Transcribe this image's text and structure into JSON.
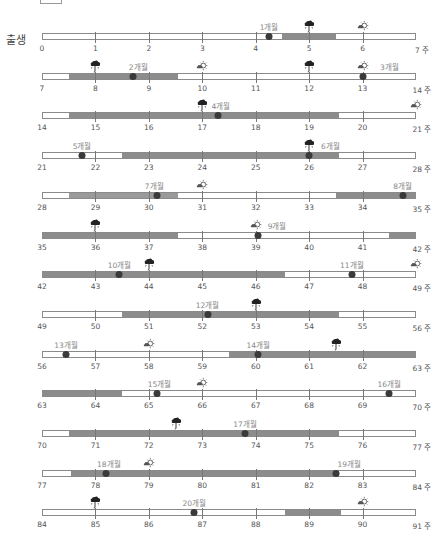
{
  "header": {
    "start_label": "출생",
    "unit": "주"
  },
  "legend_icons": {
    "rain": "cloud-rain-icon",
    "sun": "sun-cloud-icon"
  },
  "colors": {
    "segment": "#8c8c8c",
    "dot": "#3a3a3a",
    "bar_border": "#8a8a8a",
    "month_text": "#888888"
  },
  "rows": [
    {
      "start": 0,
      "ticks": [
        "0",
        "1",
        "2",
        "3",
        "4",
        "5",
        "6",
        "7 주"
      ],
      "segments": [
        [
          4.5,
          5.5
        ]
      ],
      "dots": [
        {
          "w": 4.25,
          "label": "1개월",
          "label_w": 4.25
        }
      ],
      "icons": [
        {
          "type": "rain",
          "w": 5
        },
        {
          "type": "sun",
          "w": 6
        }
      ]
    },
    {
      "start": 7,
      "ticks": [
        "7",
        "8",
        "9",
        "10",
        "11",
        "12",
        "13",
        "14 주"
      ],
      "segments": [
        [
          7.5,
          9.55
        ]
      ],
      "dots": [
        {
          "w": 8.7,
          "label": "2개월",
          "label_w": 8.8
        },
        {
          "w": 13,
          "label": "3개월",
          "label_w": 13.5
        }
      ],
      "icons": [
        {
          "type": "rain",
          "w": 8
        },
        {
          "type": "sun",
          "w": 10
        },
        {
          "type": "rain",
          "w": 12
        },
        {
          "type": "sun",
          "w": 13
        }
      ]
    },
    {
      "start": 14,
      "ticks": [
        "14",
        "15",
        "16",
        "17",
        "18",
        "19",
        "20",
        "21 주"
      ],
      "segments": [
        [
          14.5,
          19.55
        ]
      ],
      "dots": [
        {
          "w": 17.3,
          "label": "4개월",
          "label_w": 17.35
        }
      ],
      "icons": [
        {
          "type": "rain",
          "w": 17
        },
        {
          "type": "sun",
          "w": 21
        }
      ]
    },
    {
      "start": 21,
      "ticks": [
        "21",
        "22",
        "23",
        "24",
        "25",
        "26",
        "27",
        "28 주"
      ],
      "segments": [
        [
          22.5,
          26.55
        ]
      ],
      "dots": [
        {
          "w": 21.75,
          "label": "5개월",
          "label_w": 21.75
        },
        {
          "w": 26,
          "label": "6개월",
          "label_w": 26.4
        }
      ],
      "icons": [
        {
          "type": "rain",
          "w": 26
        }
      ]
    },
    {
      "start": 28,
      "ticks": [
        "28",
        "29",
        "30",
        "31",
        "32",
        "33",
        "34",
        "35 주"
      ],
      "segments": [
        [
          28.5,
          30.55,
          "light"
        ],
        [
          33.5,
          35
        ]
      ],
      "dots": [
        {
          "w": 30.15,
          "label": "7개월",
          "label_w": 30.1
        },
        {
          "w": 34.75,
          "label": "8개월",
          "label_w": 34.75
        }
      ],
      "icons": [
        {
          "type": "sun",
          "w": 31
        }
      ]
    },
    {
      "start": 35,
      "ticks": [
        "35",
        "36",
        "37",
        "38",
        "39",
        "40",
        "41",
        "42 주"
      ],
      "segments": [
        [
          35,
          37.55
        ],
        [
          41.5,
          42
        ]
      ],
      "dots": [
        {
          "w": 39.05,
          "label": "9개월",
          "label_w": 39.4
        }
      ],
      "icons": [
        {
          "type": "rain",
          "w": 36
        },
        {
          "type": "sun",
          "w": 39
        }
      ]
    },
    {
      "start": 42,
      "ticks": [
        "42",
        "43",
        "44",
        "45",
        "46",
        "47",
        "48",
        "49 주"
      ],
      "segments": [
        [
          42,
          46.55
        ]
      ],
      "dots": [
        {
          "w": 43.45,
          "label": "10개월",
          "label_w": 43.45
        },
        {
          "w": 47.8,
          "label": "11개월",
          "label_w": 47.8
        }
      ],
      "icons": [
        {
          "type": "rain",
          "w": 44
        },
        {
          "type": "sun",
          "w": 49
        }
      ]
    },
    {
      "start": 49,
      "ticks": [
        "49",
        "50",
        "51",
        "52",
        "53",
        "54",
        "55",
        "56 주"
      ],
      "segments": [
        [
          50.5,
          54.55
        ]
      ],
      "dots": [
        {
          "w": 52.1,
          "label": "12개월",
          "label_w": 52.1
        }
      ],
      "icons": [
        {
          "type": "rain",
          "w": 53
        }
      ]
    },
    {
      "start": 56,
      "ticks": [
        "56",
        "57",
        "58",
        "59",
        "60",
        "61",
        "62",
        "63 주"
      ],
      "segments": [
        [
          59.5,
          63
        ]
      ],
      "dots": [
        {
          "w": 56.45,
          "label": "13개월",
          "label_w": 56.45
        },
        {
          "w": 60.05,
          "label": "14개월",
          "label_w": 60.05
        }
      ],
      "icons": [
        {
          "type": "sun",
          "w": 58
        },
        {
          "type": "rain",
          "w": 61.5
        }
      ]
    },
    {
      "start": 63,
      "ticks": [
        "63",
        "64",
        "65",
        "66",
        "67",
        "68",
        "69",
        "70 주"
      ],
      "segments": [
        [
          63,
          64.5
        ]
      ],
      "dots": [
        {
          "w": 65.15,
          "label": "15개월",
          "label_w": 65.2
        },
        {
          "w": 69.5,
          "label": "16개월",
          "label_w": 69.5
        }
      ],
      "icons": [
        {
          "type": "sun",
          "w": 66
        }
      ]
    },
    {
      "start": 70,
      "ticks": [
        "70",
        "71",
        "72",
        "73",
        "74",
        "75",
        "76",
        "77 주"
      ],
      "segments": [
        [
          70.5,
          75.55
        ]
      ],
      "dots": [
        {
          "w": 73.8,
          "label": "17개월",
          "label_w": 73.8
        }
      ],
      "icons": [
        {
          "type": "rain",
          "w": 72.5
        }
      ]
    },
    {
      "start": 77,
      "ticks": [
        "77",
        "78",
        "79",
        "80",
        "81",
        "82",
        "83",
        "84 주"
      ],
      "segments": [
        [
          77.55,
          82.55
        ]
      ],
      "dots": [
        {
          "w": 78.2,
          "label": "18개월",
          "label_w": 78.25
        },
        {
          "w": 82.5,
          "label": "19개월",
          "label_w": 82.75
        }
      ],
      "icons": [
        {
          "type": "sun",
          "w": 79
        }
      ]
    },
    {
      "start": 84,
      "ticks": [
        "84",
        "85",
        "86",
        "87",
        "88",
        "89",
        "90",
        "91 주"
      ],
      "segments": [
        [
          88.55,
          89.6
        ]
      ],
      "dots": [
        {
          "w": 86.85,
          "label": "20개월",
          "label_w": 86.85
        }
      ],
      "icons": [
        {
          "type": "rain",
          "w": 85
        },
        {
          "type": "sun",
          "w": 90
        }
      ]
    }
  ]
}
